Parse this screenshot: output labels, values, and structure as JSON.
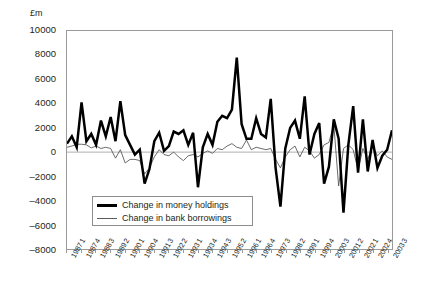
{
  "chart_data": {
    "type": "line",
    "title": "",
    "subtitle": "",
    "unit_label": "£m",
    "xlabel": "",
    "ylabel": "",
    "ylim": [
      -8000,
      10000
    ],
    "yticks": [
      10000,
      8000,
      6000,
      4000,
      2000,
      0,
      -2000,
      -4000,
      -6000,
      -8000
    ],
    "grid": false,
    "zero_line": true,
    "legend_position": "inside-bottom-left",
    "x_tick_every": 3,
    "x": [
      "1987 1",
      "1987 2",
      "1987 3",
      "1987 4",
      "1988 1",
      "1988 2",
      "1988 3",
      "1988 4",
      "1989 1",
      "1989 2",
      "1989 3",
      "1989 4",
      "1990 1",
      "1990 2",
      "1990 3",
      "1990 4",
      "1991 1",
      "1991 2",
      "1991 3",
      "1991 4",
      "1992 1",
      "1992 2",
      "1992 3",
      "1992 4",
      "1993 1",
      "1993 2",
      "1993 3",
      "1993 4",
      "1994 1",
      "1994 2",
      "1994 3",
      "1994 4",
      "1995 1",
      "1995 2",
      "1995 3",
      "1995 4",
      "1996 1",
      "1996 2",
      "1996 3",
      "1996 4",
      "1997 1",
      "1997 2",
      "1997 3",
      "1997 4",
      "1998 1",
      "1998 2",
      "1998 3",
      "1998 4",
      "1999 1",
      "1999 2",
      "1999 3",
      "1999 4",
      "2000 1",
      "2000 2",
      "2000 3",
      "2000 4",
      "2001 1",
      "2001 2",
      "2001 3",
      "2001 4",
      "2002 1",
      "2002 2",
      "2002 3",
      "2002 4",
      "2003 1",
      "2003 2",
      "2003 3",
      "2003 4"
    ],
    "xtick_labels": [
      "1987 1",
      "1987 4",
      "1988 3",
      "1989 2",
      "1990 1",
      "1990 4",
      "1991 3",
      "1992 2",
      "1993 1",
      "1993 4",
      "1994 3",
      "1995 2",
      "1996 1",
      "1996 4",
      "1997 3",
      "1998 2",
      "1999 1",
      "1999 4",
      "2000 3",
      "2001 2",
      "2002 1",
      "2002 4",
      "2003 3"
    ],
    "series": [
      {
        "name": "Change in money holdings",
        "style": "thick",
        "color": "#000000",
        "values": [
          700,
          1300,
          400,
          4100,
          900,
          1500,
          600,
          2600,
          1300,
          2900,
          900,
          4200,
          1400,
          600,
          -200,
          200,
          -2600,
          -1400,
          900,
          1600,
          100,
          500,
          1700,
          1500,
          1800,
          600,
          1600,
          -2900,
          400,
          1500,
          600,
          2500,
          3000,
          2800,
          3500,
          7800,
          2300,
          1100,
          1100,
          2800,
          1500,
          1200,
          4400,
          -1300,
          -4500,
          300,
          2000,
          2600,
          1100,
          4600,
          -200,
          1500,
          2400,
          -2600,
          -1200,
          2700,
          1100,
          -5000,
          600,
          3800,
          -1700,
          2700,
          -1600,
          1000,
          -1300,
          -300,
          200,
          1800
        ]
      },
      {
        "name": "Change in bank borrowings",
        "style": "thin",
        "color": "#5a5a5a",
        "values": [
          400,
          500,
          650,
          650,
          600,
          350,
          500,
          300,
          400,
          300,
          -500,
          200,
          -900,
          -600,
          -600,
          -700,
          -1800,
          -1300,
          -400,
          200,
          -200,
          -300,
          0,
          -400,
          -700,
          -300,
          -200,
          -400,
          -100,
          100,
          -100,
          300,
          200,
          500,
          700,
          400,
          300,
          1000,
          200,
          400,
          300,
          200,
          300,
          -600,
          -1300,
          -400,
          200,
          500,
          -400,
          400,
          100,
          -500,
          -200,
          600,
          800,
          2300,
          -2800,
          300,
          600,
          200,
          -1500,
          300,
          -600,
          500,
          -300,
          100,
          -400,
          -600
        ]
      }
    ]
  },
  "legend": {
    "items": [
      {
        "label": "Change in money holdings"
      },
      {
        "label": "Change in bank borrowings"
      }
    ]
  }
}
